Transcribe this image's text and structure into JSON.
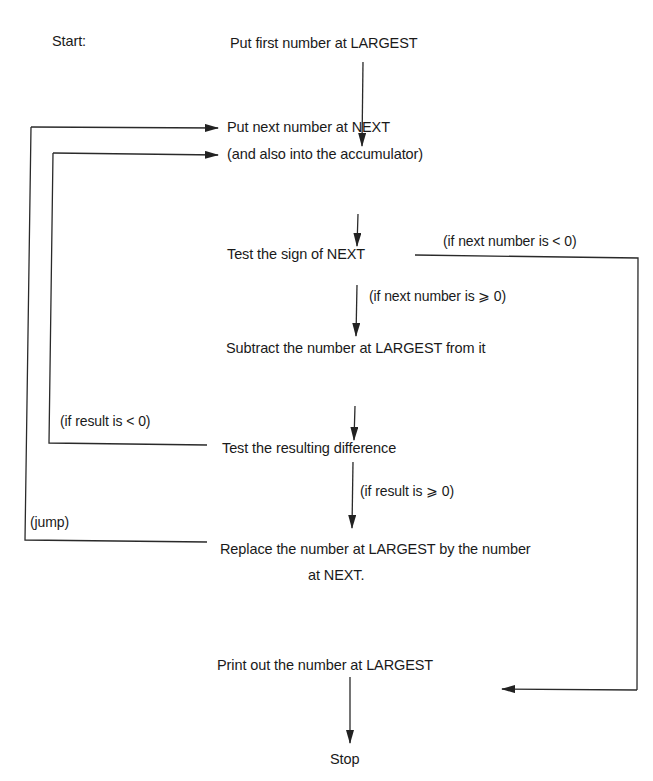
{
  "diagram": {
    "type": "flowchart",
    "start_label": "Start:",
    "nodes": [
      {
        "id": "n1",
        "text": "Put first number at LARGEST"
      },
      {
        "id": "n2",
        "line1": "Put next number at NEXT",
        "line2": "(and also into the accumulator)"
      },
      {
        "id": "n3",
        "text": "Test the sign of NEXT"
      },
      {
        "id": "n4",
        "text": "Subtract the number at LARGEST from it"
      },
      {
        "id": "n5",
        "text": "Test the resulting difference"
      },
      {
        "id": "n6",
        "line1": "Replace the number at LARGEST by the number",
        "line2": "at NEXT."
      },
      {
        "id": "n7",
        "text": "Print out the number at LARGEST"
      },
      {
        "id": "n8",
        "text": "Stop"
      }
    ],
    "edge_labels": {
      "next_negative": "(if next number is < 0)",
      "next_nonnegative": "(if next number is ⩾ 0)",
      "result_negative": "(if result is < 0)",
      "result_nonnegative": "(if result is ⩾ 0)",
      "jump": "(jump)"
    },
    "edges": [
      {
        "from": "n1",
        "to": "n2"
      },
      {
        "from": "n2",
        "to": "n3"
      },
      {
        "from": "n3",
        "to": "n4",
        "label": "(if next number is ⩾ 0)"
      },
      {
        "from": "n3",
        "to": "n7",
        "label": "(if next number is < 0)"
      },
      {
        "from": "n4",
        "to": "n5"
      },
      {
        "from": "n5",
        "to": "n6",
        "label": "(if result is ⩾ 0)"
      },
      {
        "from": "n5",
        "to": "n2",
        "label": "(if result is < 0)"
      },
      {
        "from": "n6",
        "to": "n2",
        "label": "(jump)"
      },
      {
        "from": "n7",
        "to": "n8"
      }
    ],
    "line_color": "#2a2a2a"
  }
}
